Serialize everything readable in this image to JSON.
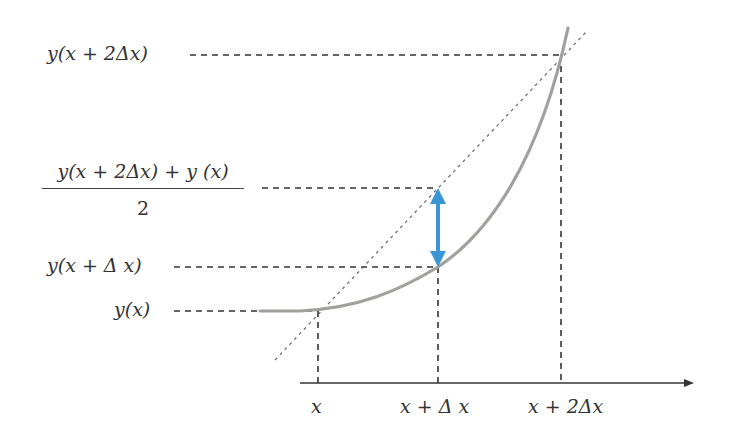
{
  "diagram": {
    "y_labels": {
      "y_x2": "y(x + 2Δx)",
      "y_mid_numerator": "y(x + 2Δx) + y (x)",
      "y_mid_denominator": "2",
      "y_x1": "y(x + Δ x)",
      "y_x0": "y(x)"
    },
    "x_labels": {
      "x0": "x",
      "x1": "x + Δ x",
      "x2": "x + 2Δx"
    },
    "colors": {
      "curve": "#a0a09c",
      "dashed": "#333333",
      "secant": "#555555",
      "arrow": "#3a96d4",
      "axis": "#333333"
    }
  }
}
